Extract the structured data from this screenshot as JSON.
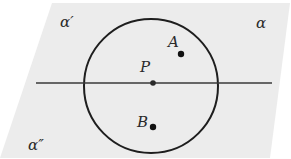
{
  "diagram": {
    "type": "geometry-figure",
    "colors": {
      "background": "#ffffff",
      "plane_fill": "#ececec",
      "stroke": "#1e1e1e",
      "label": "#2a2a2a"
    },
    "plane": {
      "polygon": [
        [
          52,
          3
        ],
        [
          290,
          3
        ],
        [
          270,
          158
        ],
        [
          0,
          158
        ]
      ]
    },
    "line": {
      "x1": 36,
      "y1": 83,
      "x2": 272,
      "y2": 83
    },
    "circle": {
      "cx": 151,
      "cy": 86,
      "r": 67
    },
    "points": [
      {
        "id": "P",
        "label": "P",
        "x": 153,
        "y": 83,
        "label_x": 140,
        "label_y": 60
      },
      {
        "id": "A",
        "label": "A",
        "x": 181,
        "y": 54,
        "label_x": 168,
        "label_y": 35
      },
      {
        "id": "B",
        "label": "B",
        "x": 153,
        "y": 127,
        "label_x": 137,
        "label_y": 115
      }
    ],
    "plane_labels": [
      {
        "id": "alpha-prime",
        "label": "α′",
        "x": 60,
        "y": 15
      },
      {
        "id": "alpha",
        "label": "α",
        "x": 256,
        "y": 16
      },
      {
        "id": "alpha-double-prime",
        "label": "α″",
        "x": 28,
        "y": 138
      }
    ]
  }
}
